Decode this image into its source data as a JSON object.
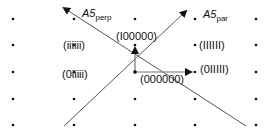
{
  "diagram": {
    "grid": {
      "columns_x": [
        13,
        74,
        135,
        195,
        256
      ],
      "rows_y": [
        19,
        45,
        72,
        99,
        125
      ],
      "dot_color": "#111111"
    },
    "origin": {
      "x": 135,
      "y": 72
    },
    "axes": [
      {
        "id": "perp",
        "label": "A5",
        "subscript": "perp",
        "from": [
          246,
          126
        ],
        "to": [
          63,
          7
        ]
      },
      {
        "id": "par",
        "label": "A5",
        "subscript": "par",
        "from": [
          64,
          126
        ],
        "to": [
          187,
          10
        ]
      }
    ],
    "vectors": [
      {
        "id": "up",
        "label": "(I00000)",
        "to": [
          135,
          47
        ]
      },
      {
        "id": "right",
        "label": "(000000)",
        "to": [
          192,
          72
        ]
      }
    ],
    "point_labels": [
      {
        "text": "(IIIIII)",
        "x": 199,
        "y": 49
      },
      {
        "text": "(0IIIII)",
        "x": 218,
        "y": 76
      },
      {
        "text": "(iiiiii)",
        "x": 50,
        "y": 49
      },
      {
        "text": "(0iiiii)",
        "x": 50,
        "y": 78
      },
      {
        "text": "(I00000)",
        "x": 115,
        "y": 40
      },
      {
        "text": "(000000)",
        "x": 153,
        "y": 82
      }
    ],
    "line_color": "#555555"
  }
}
